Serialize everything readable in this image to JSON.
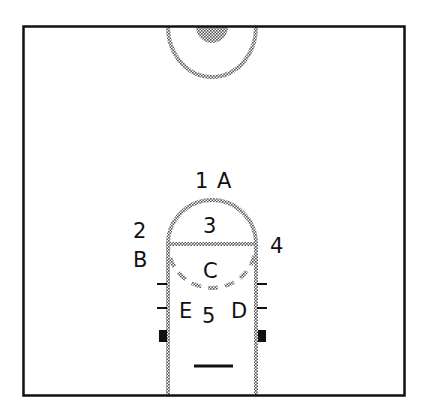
{
  "diagram": {
    "type": "basketball-court-positions",
    "colors": {
      "outline": "#111111",
      "dotted_line": "#8a8a8a",
      "background": "#ffffff"
    },
    "labels": {
      "pos1": "1",
      "posA": "A",
      "pos2": "2",
      "posB": "B",
      "pos3": "3",
      "pos4": "4",
      "posC": "C",
      "posE": "E",
      "pos5": "5",
      "posD": "D"
    }
  }
}
